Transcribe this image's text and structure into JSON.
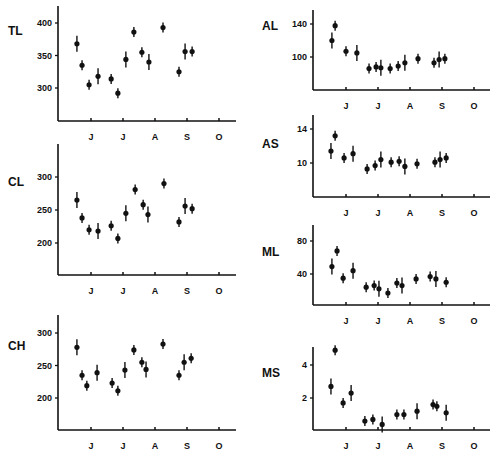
{
  "figure": {
    "months": [
      "J",
      "J",
      "A",
      "S",
      "O"
    ]
  },
  "chart_data": [
    {
      "type": "scatter",
      "panel": "TL",
      "title": "TL",
      "xlabel": "",
      "ylabel": "TL",
      "xticks": [
        "J",
        "J",
        "A",
        "S",
        "O"
      ],
      "yticks": [
        300,
        350,
        400
      ],
      "ylim": [
        250,
        420
      ],
      "error_bars": true,
      "x": [
        -0.44,
        -0.28,
        -0.06,
        0.22,
        0.63,
        0.84,
        1.09,
        1.34,
        1.59,
        1.81,
        2.25,
        2.75,
        2.94,
        3.16
      ],
      "values": [
        368,
        335,
        305,
        318,
        314,
        292,
        344,
        386,
        355,
        340,
        393,
        325,
        356,
        356
      ]
    },
    {
      "type": "scatter",
      "panel": "CL",
      "title": "CL",
      "xlabel": "",
      "ylabel": "CL",
      "xticks": [
        "J",
        "J",
        "A",
        "S",
        "O"
      ],
      "yticks": [
        200,
        250,
        300
      ],
      "ylim": [
        150,
        320
      ],
      "error_bars": true,
      "x": [
        -0.44,
        -0.28,
        -0.06,
        0.22,
        0.63,
        0.84,
        1.09,
        1.38,
        1.63,
        1.78,
        2.28,
        2.75,
        2.94,
        3.16
      ],
      "values": [
        265,
        238,
        220,
        218,
        226,
        207,
        245,
        281,
        258,
        243,
        290,
        232,
        256,
        252
      ]
    },
    {
      "type": "scatter",
      "panel": "CH",
      "title": "CH",
      "xlabel": "",
      "ylabel": "CH",
      "xticks": [
        "J",
        "J",
        "A",
        "S",
        "O"
      ],
      "yticks": [
        200,
        250,
        300
      ],
      "ylim": [
        150,
        320
      ],
      "error_bars": true,
      "x": [
        -0.44,
        -0.28,
        -0.13,
        0.19,
        0.66,
        0.84,
        1.06,
        1.34,
        1.59,
        1.72,
        2.25,
        2.75,
        2.91,
        3.13
      ],
      "values": [
        278,
        235,
        219,
        239,
        223,
        211,
        243,
        274,
        255,
        244,
        283,
        235,
        255,
        261
      ]
    },
    {
      "type": "scatter",
      "panel": "AL",
      "title": "AL",
      "xlabel": "",
      "ylabel": "AL",
      "xticks": [
        "J",
        "J",
        "A",
        "S",
        "O"
      ],
      "yticks": [
        100,
        140
      ],
      "ylim": [
        60,
        155
      ],
      "error_bars": true,
      "x": [
        -0.44,
        -0.34,
        0.0,
        0.34,
        0.72,
        0.94,
        1.09,
        1.38,
        1.63,
        1.84,
        2.25,
        2.75,
        2.91,
        3.09
      ],
      "values": [
        120,
        138,
        107,
        105,
        86,
        88,
        87,
        86,
        89,
        93,
        98,
        93,
        97,
        98
      ]
    },
    {
      "type": "scatter",
      "panel": "AS",
      "title": "AS",
      "xlabel": "",
      "ylabel": "AS",
      "xticks": [
        "J",
        "J",
        "A",
        "S",
        "O"
      ],
      "yticks": [
        10,
        14
      ],
      "ylim": [
        6,
        15.5
      ],
      "error_bars": true,
      "x": [
        -0.47,
        -0.34,
        -0.06,
        0.22,
        0.66,
        0.91,
        1.09,
        1.41,
        1.66,
        1.84,
        2.22,
        2.78,
        2.94,
        3.13
      ],
      "values": [
        11.4,
        13.2,
        10.6,
        11.1,
        9.3,
        9.7,
        10.4,
        10.1,
        10.2,
        9.6,
        9.9,
        10.1,
        10.4,
        10.6
      ]
    },
    {
      "type": "scatter",
      "panel": "ML",
      "title": "ML",
      "xlabel": "",
      "ylabel": "ML",
      "xticks": [
        "J",
        "J",
        "A",
        "S",
        "O"
      ],
      "yticks": [
        40,
        80
      ],
      "ylim": [
        0,
        95
      ],
      "error_bars": true,
      "x": [
        -0.44,
        -0.28,
        -0.09,
        0.22,
        0.63,
        0.88,
        1.03,
        1.31,
        1.59,
        1.75,
        2.19,
        2.63,
        2.81,
        3.13
      ],
      "values": [
        49,
        68,
        35,
        44,
        24,
        26,
        22,
        17,
        29,
        26,
        34,
        37,
        34,
        30
      ]
    },
    {
      "type": "scatter",
      "panel": "MS",
      "title": "MS",
      "xlabel": "",
      "ylabel": "MS",
      "xticks": [
        "J",
        "J",
        "A",
        "S",
        "O"
      ],
      "yticks": [
        2,
        4
      ],
      "ylim": [
        0,
        5.3
      ],
      "error_bars": true,
      "x": [
        -0.47,
        -0.34,
        -0.09,
        0.16,
        0.59,
        0.84,
        1.13,
        1.59,
        1.81,
        2.22,
        2.72,
        2.84,
        3.13
      ],
      "values": [
        2.7,
        4.9,
        1.7,
        2.3,
        0.6,
        0.7,
        0.4,
        1.0,
        1.0,
        1.2,
        1.6,
        1.5,
        1.1
      ]
    }
  ]
}
